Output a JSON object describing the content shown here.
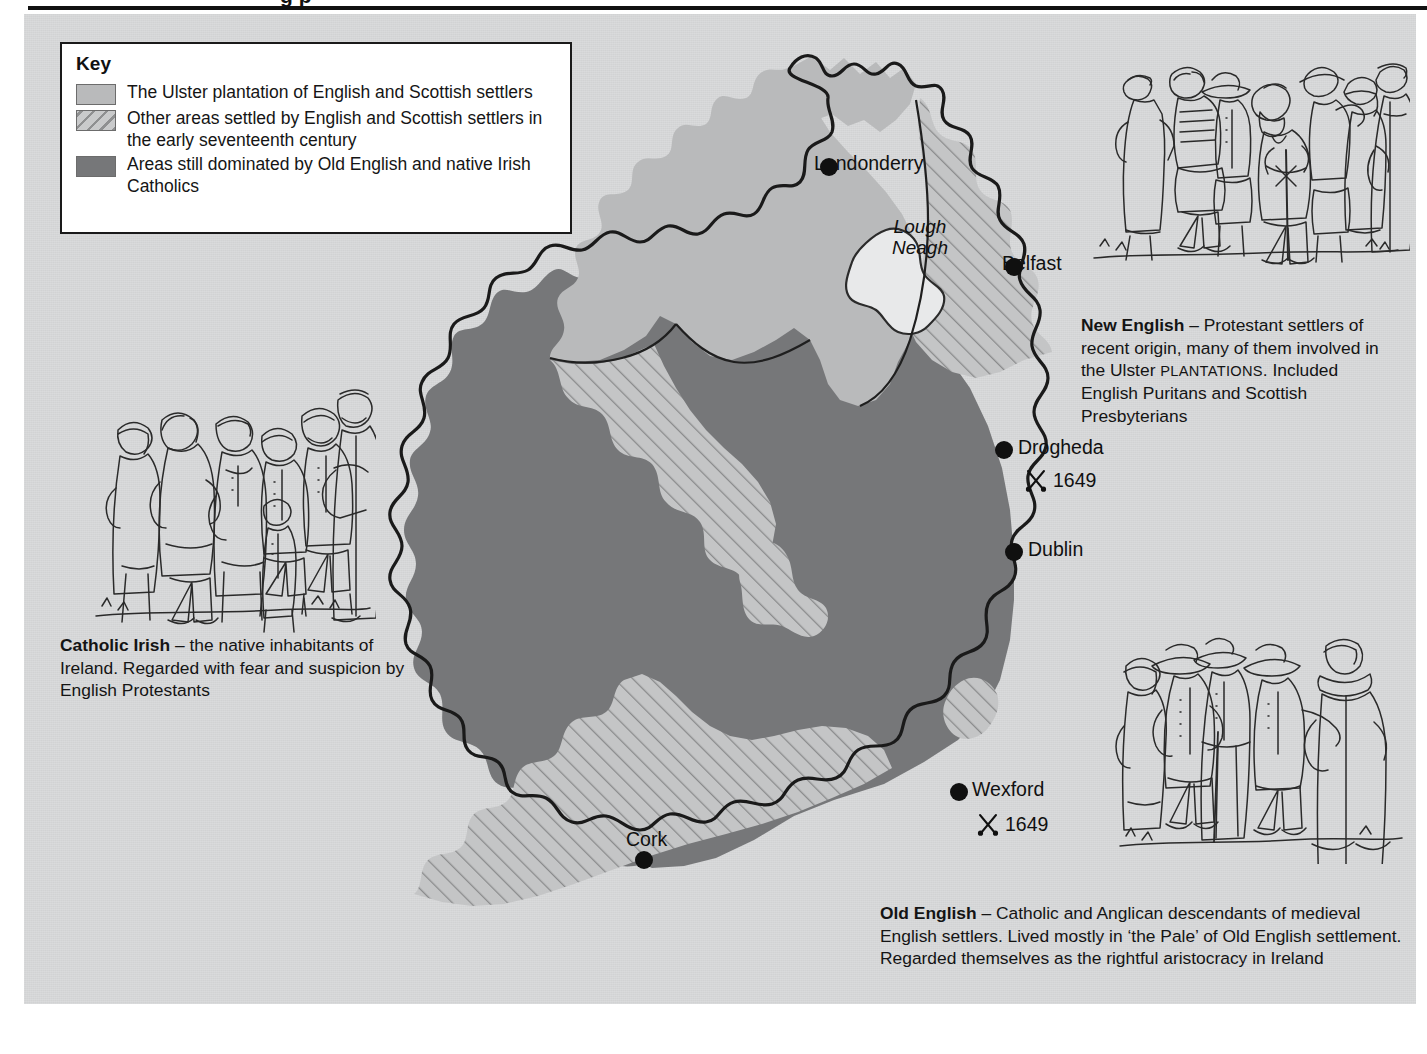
{
  "page": {
    "background_color": "#ffffff",
    "panel_color": "#d9dadb",
    "top_rule_color": "#111111",
    "partial_heading_fragment": "g p"
  },
  "key": {
    "title": "Key",
    "items": [
      {
        "swatch": "solid-light-gray",
        "color": "#b9babb",
        "label": "The Ulster plantation of English and Scottish settlers"
      },
      {
        "swatch": "diagonal-hatch",
        "color": "#c9cacb",
        "hatch_color": "#8f9091",
        "label": "Other areas settled by English and Scottish settlers in the early seventeenth century"
      },
      {
        "swatch": "solid-dark-gray",
        "color": "#767779",
        "label": "Areas still dominated by Old English and native Irish Catholics"
      }
    ]
  },
  "map": {
    "colors": {
      "ulster_plantation": "#b9babb",
      "other_settled_fill": "#c9cacb",
      "other_settled_hatch": "#8f9091",
      "catholic_dominated": "#767779",
      "lough": "#e8e9ea",
      "coastline": "#1a1a1a",
      "sea": "#d9dadb"
    },
    "places": [
      {
        "name": "Londonderry",
        "type": "city",
        "x": 505,
        "y": 127
      },
      {
        "name": "Belfast",
        "type": "city",
        "x": 690,
        "y": 227
      },
      {
        "name": "Drogheda",
        "type": "city",
        "x": 680,
        "y": 410
      },
      {
        "name": "Dublin",
        "type": "city",
        "x": 690,
        "y": 512
      },
      {
        "name": "Wexford",
        "type": "city",
        "x": 635,
        "y": 752
      },
      {
        "name": "Cork",
        "type": "city",
        "x": 320,
        "y": 820
      }
    ],
    "water_labels": [
      {
        "name": "Lough Neagh",
        "line1": "Lough",
        "line2": "Neagh",
        "style": "italic"
      }
    ],
    "battles": [
      {
        "place": "Drogheda",
        "year": "1649",
        "symbol": "crossed-swords"
      },
      {
        "place": "Wexford",
        "year": "1649",
        "symbol": "crossed-swords"
      }
    ]
  },
  "annotations": [
    {
      "id": "new-english",
      "title": "New English",
      "dash": " – ",
      "body_1": "Protestant settlers of recent origin, many of them involved in the Ulster ",
      "smallcaps": "PLANTATIONS",
      "body_2": ". Included English Puritans and Scottish Presbyterians",
      "illustration": "group-of-settlers-with-minister"
    },
    {
      "id": "catholic-irish",
      "title": "Catholic Irish",
      "dash": " – ",
      "body_1": "the native inhabitants of Ireland. Regarded with fear and suspicion by English Protestants",
      "smallcaps": "",
      "body_2": "",
      "illustration": "group-of-irish-peasants-with-priest"
    },
    {
      "id": "old-english",
      "title": "Old English",
      "dash": " – ",
      "body_1": "Catholic and Anglican descendants of medieval English settlers. Lived mostly in ‘the Pale’ of Old English settlement. Regarded themselves as the rightful aristocracy in Ireland",
      "smallcaps": "",
      "body_2": "",
      "illustration": "group-of-gentry-with-cleric"
    }
  ]
}
